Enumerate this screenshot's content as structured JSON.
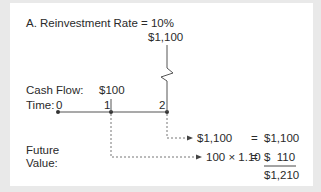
{
  "title": "A.  Reinvestment Rate = 10%",
  "cash_flow_label": "Cash Flow:",
  "time_label": "Time:",
  "time_points": [
    "0",
    "1",
    "2"
  ],
  "cash_flows": {
    "t1": "$100",
    "t2": "$1,100"
  },
  "future_value_label_line1": "Future",
  "future_value_label_line2": "Value:",
  "computations": [
    {
      "expr": "$1,100",
      "eq": "=",
      "result": "$1,100"
    },
    {
      "expr": "100 × 1.10",
      "eq": "=",
      "result": "$  110"
    }
  ],
  "total": "$1,210",
  "colors": {
    "line": "#555555",
    "text": "#2a2a2a",
    "border_bg": "#e9e9e9",
    "card_bg": "#ffffff"
  }
}
